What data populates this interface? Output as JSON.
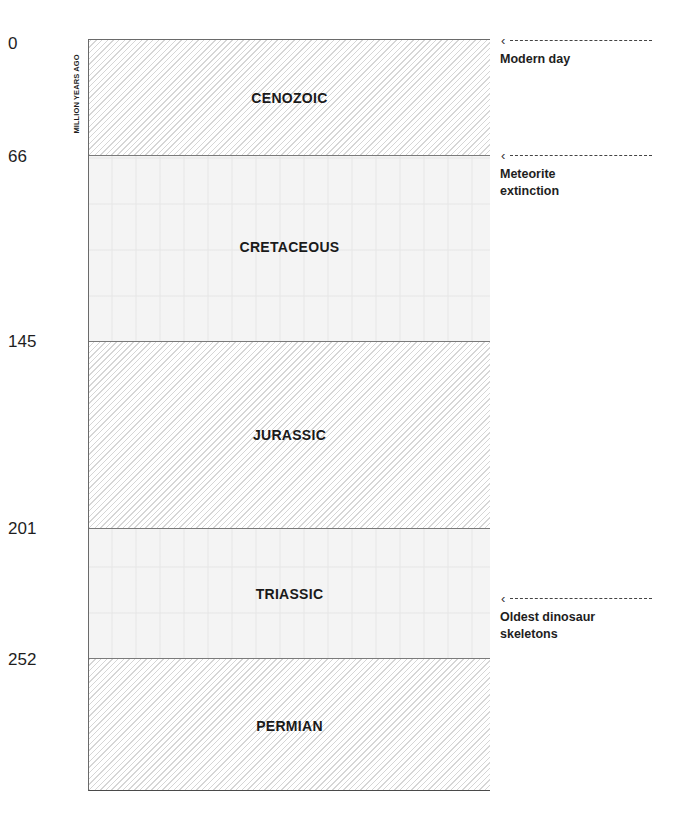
{
  "axis": {
    "title": "MILLION YEARS AGO",
    "ticks": [
      {
        "value": "0",
        "y": 43
      },
      {
        "value": "66",
        "y": 156
      },
      {
        "value": "145",
        "y": 341
      },
      {
        "value": "201",
        "y": 528
      },
      {
        "value": "252",
        "y": 658
      }
    ]
  },
  "periods": [
    {
      "name": "CENOZOIC",
      "start_mya": 0,
      "end_mya": 66,
      "style": "hatched"
    },
    {
      "name": "CRETACEOUS",
      "start_mya": 66,
      "end_mya": 145,
      "style": "plain"
    },
    {
      "name": "JURASSIC",
      "start_mya": 145,
      "end_mya": 201,
      "style": "hatched"
    },
    {
      "name": "TRIASSIC",
      "start_mya": 201,
      "end_mya": 252,
      "style": "plain"
    },
    {
      "name": "PERMIAN",
      "start_mya": 252,
      "end_mya": null,
      "style": "hatched"
    }
  ],
  "annotations": [
    {
      "text": "Modern day",
      "arrow_icon": "left-arrow-icon",
      "at_mya": 0
    },
    {
      "text": "Meteorite extinction",
      "arrow_icon": "left-arrow-icon",
      "at_mya": 66
    },
    {
      "text": "Oldest dinosaur skeletons",
      "arrow_icon": "left-arrow-icon",
      "at_mya": 230
    }
  ],
  "colors": {
    "line": "#7a7a7a",
    "hatch": "#d6d6d6",
    "text": "#1a1a1a",
    "plain_fill": "#f4f4f4"
  }
}
